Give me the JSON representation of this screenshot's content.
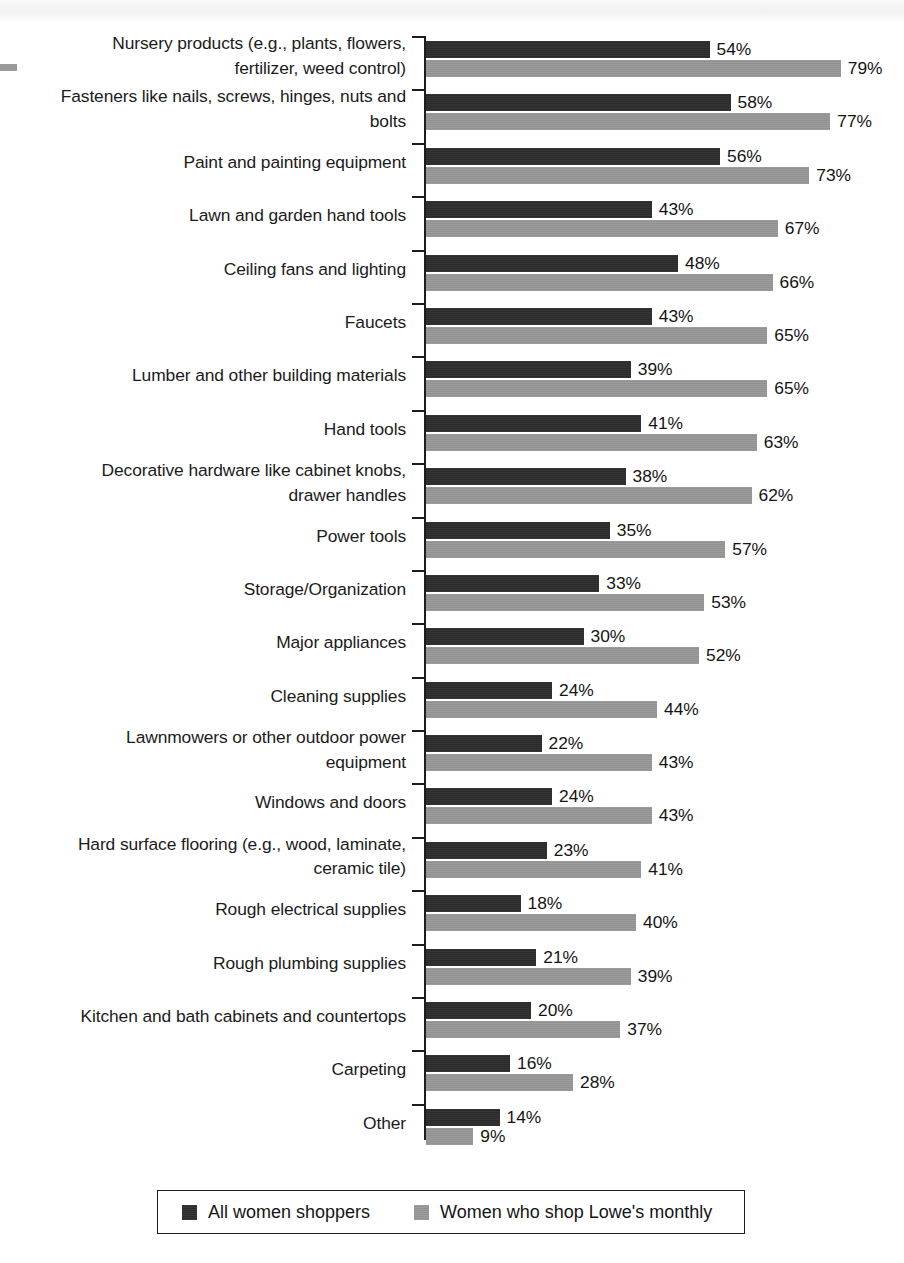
{
  "chart_data": {
    "type": "bar",
    "orientation": "horizontal",
    "title": "",
    "xlabel": "",
    "ylabel": "",
    "xlim": [
      0,
      100
    ],
    "grid": false,
    "legend_position": "bottom",
    "value_suffix": "%",
    "categories": [
      "Nursery products (e.g., plants, flowers, fertilizer, weed control)",
      "Fasteners like nails, screws, hinges, nuts and bolts",
      "Paint and painting equipment",
      "Lawn and garden hand tools",
      "Ceiling fans and lighting",
      "Faucets",
      "Lumber and other building materials",
      "Hand tools",
      "Decorative hardware like cabinet knobs, drawer handles",
      "Power tools",
      "Storage/Organization",
      "Major appliances",
      "Cleaning supplies",
      "Lawnmowers or other outdoor power equipment",
      "Windows and doors",
      "Hard surface flooring (e.g., wood, laminate, ceramic tile)",
      "Rough electrical supplies",
      "Rough plumbing supplies",
      "Kitchen and bath cabinets and countertops",
      "Carpeting",
      "Other"
    ],
    "category_lines": [
      [
        "Nursery products (e.g., plants, flowers,",
        "fertilizer, weed control)"
      ],
      [
        "Fasteners like nails, screws, hinges, nuts and",
        "bolts"
      ],
      [
        "Paint and painting equipment"
      ],
      [
        "Lawn and garden hand tools"
      ],
      [
        "Ceiling fans and lighting"
      ],
      [
        "Faucets"
      ],
      [
        "Lumber and other building materials"
      ],
      [
        "Hand tools"
      ],
      [
        "Decorative hardware like cabinet knobs,",
        "drawer handles"
      ],
      [
        "Power tools"
      ],
      [
        "Storage/Organization"
      ],
      [
        "Major appliances"
      ],
      [
        "Cleaning supplies"
      ],
      [
        "Lawnmowers or other outdoor power",
        "equipment"
      ],
      [
        "Windows and doors"
      ],
      [
        "Hard surface flooring (e.g., wood, laminate,",
        "ceramic tile)"
      ],
      [
        "Rough electrical supplies"
      ],
      [
        "Rough plumbing supplies"
      ],
      [
        "Kitchen and bath cabinets and countertops"
      ],
      [
        "Carpeting"
      ],
      [
        "Other"
      ]
    ],
    "series": [
      {
        "name": "All women shoppers",
        "color": "#2b2b2b",
        "values": [
          54,
          58,
          56,
          43,
          48,
          43,
          39,
          41,
          38,
          35,
          33,
          30,
          24,
          22,
          24,
          23,
          18,
          21,
          20,
          16,
          14
        ],
        "labels": [
          "54%",
          "58%",
          "56%",
          "43%",
          "48%",
          "43%",
          "39%",
          "41%",
          "38%",
          "35%",
          "33%",
          "30%",
          "24%",
          "22%",
          "24%",
          "23%",
          "18%",
          "21%",
          "20%",
          "16%",
          "14%"
        ]
      },
      {
        "name": "Women who shop Lowe's monthly",
        "color": "#919191",
        "values": [
          79,
          77,
          73,
          67,
          66,
          65,
          65,
          63,
          62,
          57,
          53,
          52,
          44,
          43,
          43,
          41,
          40,
          39,
          37,
          28,
          9
        ],
        "labels": [
          "79%",
          "77%",
          "73%",
          "67%",
          "66%",
          "65%",
          "65%",
          "63%",
          "62%",
          "57%",
          "53%",
          "52%",
          "44%",
          "43%",
          "43%",
          "41%",
          "40%",
          "39%",
          "37%",
          "28%",
          "9%"
        ]
      }
    ]
  },
  "legend": {
    "items": [
      {
        "label": "All women shoppers",
        "swatch": "dark"
      },
      {
        "label": "Women who shop Lowe's monthly",
        "swatch": "gray"
      }
    ]
  }
}
